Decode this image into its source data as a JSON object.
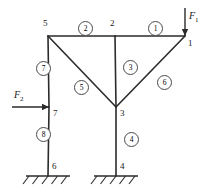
{
  "figure": {
    "type": "structural-frame-diagram",
    "line_color": "#2b2b2b",
    "label_color": "#1a1a1a"
  },
  "nodes": [
    {
      "id": "1",
      "label": "1",
      "x": 185,
      "y": 36,
      "label_x": 188,
      "label_y": 39
    },
    {
      "id": "2",
      "label": "2",
      "x": 115,
      "y": 36,
      "label_x": 110,
      "label_y": 19
    },
    {
      "id": "3",
      "label": "3",
      "x": 116,
      "y": 107,
      "label_x": 120,
      "label_y": 109
    },
    {
      "id": "4",
      "label": "4",
      "x": 116,
      "y": 176,
      "label_x": 120,
      "label_y": 162
    },
    {
      "id": "5",
      "label": "5",
      "x": 48,
      "y": 36,
      "label_x": 43,
      "label_y": 19
    },
    {
      "id": "6",
      "label": "6",
      "x": 48,
      "y": 176,
      "label_x": 52,
      "label_y": 162
    },
    {
      "id": "7",
      "label": "7",
      "x": 49,
      "y": 107,
      "label_x": 53,
      "label_y": 109
    }
  ],
  "members": [
    {
      "id": "e1",
      "label": "1",
      "from": "2",
      "to": "1",
      "badge_x": 148,
      "badge_y": 21
    },
    {
      "id": "e2",
      "label": "2",
      "from": "5",
      "to": "2",
      "badge_x": 78,
      "badge_y": 21
    },
    {
      "id": "e3",
      "label": "3",
      "from": "2",
      "to": "3",
      "badge_x": 123,
      "badge_y": 60
    },
    {
      "id": "e4",
      "label": "4",
      "from": "3",
      "to": "4",
      "badge_x": 124,
      "badge_y": 132
    },
    {
      "id": "e5",
      "label": "5",
      "from": "5",
      "to": "3",
      "badge_x": 74,
      "badge_y": 80
    },
    {
      "id": "e6",
      "label": "6",
      "from": "3",
      "to": "1",
      "badge_x": 157,
      "badge_y": 75
    },
    {
      "id": "e7",
      "label": "7",
      "from": "5",
      "to": "7",
      "badge_x": 36,
      "badge_y": 61
    },
    {
      "id": "e8",
      "label": "8",
      "from": "7",
      "to": "6",
      "badge_x": 36,
      "badge_y": 127
    }
  ],
  "loads": [
    {
      "id": "F1",
      "name": "F",
      "sub": "1",
      "at_node": "1",
      "direction": "down",
      "tail_x": 185,
      "tail_y": 8,
      "head_x": 185,
      "head_y": 36,
      "label_x": 189,
      "label_y": 11
    },
    {
      "id": "F2",
      "name": "F",
      "sub": "2",
      "at_node": "7",
      "direction": "right",
      "tail_x": 12,
      "tail_y": 107,
      "head_x": 49,
      "head_y": 107,
      "label_x": 14,
      "label_y": 90
    }
  ],
  "supports": [
    {
      "id": "s6",
      "at_node": "6",
      "type": "fixed-ground-hatch",
      "x": 48,
      "y": 176,
      "half_width": 22
    },
    {
      "id": "s4",
      "at_node": "4",
      "type": "fixed-ground-hatch",
      "x": 116,
      "y": 176,
      "half_width": 22
    }
  ]
}
